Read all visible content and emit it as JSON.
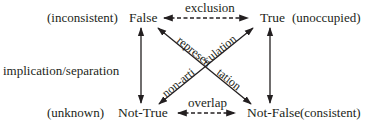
{
  "diagram": {
    "nodes": {
      "top_left": {
        "label": "False",
        "annotation": "(inconsistent)"
      },
      "top_right": {
        "label": "True",
        "annotation": "(unoccupied)"
      },
      "bottom_left": {
        "label": "Not-True",
        "annotation": "(unknown)"
      },
      "bottom_right": {
        "label": "Not-False",
        "annotation": "(consistent)"
      }
    },
    "edges": {
      "top": {
        "label": "exclusion",
        "style": "dashed",
        "direction": "both"
      },
      "bottom": {
        "label": "overlap",
        "style": "dashed",
        "direction": "both"
      },
      "left": {
        "label": "implication/separation",
        "style": "solid",
        "direction": "both"
      },
      "right": {
        "label": "",
        "style": "solid",
        "direction": "both"
      },
      "diagonal_up": {
        "label_part1": "non-arti",
        "label_part2": "culation",
        "from": "Not-True",
        "to": "True",
        "direction": "both"
      },
      "diagonal_down": {
        "label_part1": "represen",
        "label_part2": "tation",
        "from": "False",
        "to": "Not-False",
        "direction": "both"
      }
    },
    "colors": {
      "ink": "#231f20",
      "background": "#ffffff"
    }
  }
}
